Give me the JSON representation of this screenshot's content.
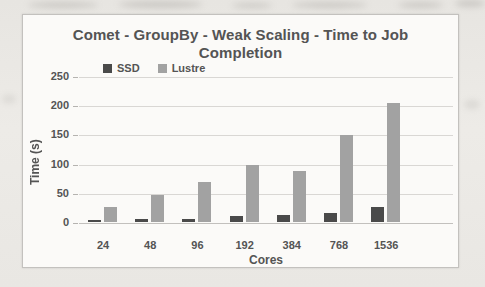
{
  "chart_data": {
    "type": "bar",
    "title_lines": [
      "Comet - GroupBy - Weak Scaling - Time to Job",
      "Completion"
    ],
    "categories": [
      "24",
      "48",
      "96",
      "192",
      "384",
      "768",
      "1536"
    ],
    "series": [
      {
        "name": "SSD",
        "color": "#4a4a4a",
        "values": [
          3,
          5,
          6,
          10,
          12,
          16,
          26
        ]
      },
      {
        "name": "Lustre",
        "color": "#a2a2a2",
        "values": [
          26,
          47,
          68,
          97,
          88,
          149,
          203
        ]
      }
    ],
    "xlabel": "Cores",
    "ylabel": "Time (s)",
    "ylim": [
      0,
      250
    ],
    "yticks": [
      0,
      50,
      100,
      150,
      200,
      250
    ],
    "grid": true,
    "legend_position": "top-left",
    "text_color": "#545454",
    "gridline_color": "#d9d7d4",
    "plot_background": "#fbfaf8"
  }
}
